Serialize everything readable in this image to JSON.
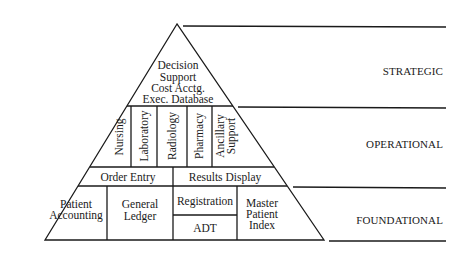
{
  "diagram": {
    "type": "pyramid",
    "levels": [
      {
        "name": "STRATEGIC"
      },
      {
        "name": "OPERATIONAL"
      },
      {
        "name": "FOUNDATIONAL"
      }
    ],
    "strategic": {
      "lines": [
        "Decision",
        "Support",
        "Cost Acctg.",
        "Exec. Database"
      ]
    },
    "operational": {
      "vertical_labels": [
        {
          "lines": [
            "Nursing"
          ]
        },
        {
          "lines": [
            "Laboratory"
          ]
        },
        {
          "lines": [
            "Radiology"
          ]
        },
        {
          "lines": [
            "Pharmacy"
          ]
        },
        {
          "lines": [
            "Ancillary",
            "Support"
          ]
        }
      ],
      "order_entry": "Order Entry",
      "results_display": "Results Display"
    },
    "foundational": {
      "patient_accounting": [
        "Patient",
        "Accounting"
      ],
      "general_ledger": [
        "General",
        "Ledger"
      ],
      "registration": "Registration",
      "adt": "ADT",
      "master_patient_index": [
        "Master",
        "Patient",
        "Index"
      ]
    }
  }
}
